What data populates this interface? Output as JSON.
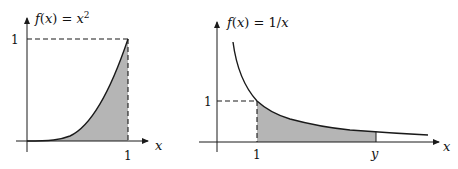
{
  "left_plot": {
    "function_label": "f(x) = x²",
    "function_label_parts": {
      "lhs": "f(x) = x",
      "sup": "2"
    },
    "x_axis_label": "x",
    "x_tick_label": "1",
    "y_tick_label": "1",
    "shaded_region": "area under x² from 0 to 1"
  },
  "right_plot": {
    "function_label": "f(x) = 1/x",
    "x_axis_label": "x",
    "x_tick_label_1": "1",
    "x_tick_label_y": "y",
    "y_tick_label": "1",
    "shaded_region": "area under 1/x from 1 to y"
  },
  "colors": {
    "curve": "#1a1a1a",
    "shade": "#b3b3b3",
    "axis": "#1a1a1a"
  }
}
